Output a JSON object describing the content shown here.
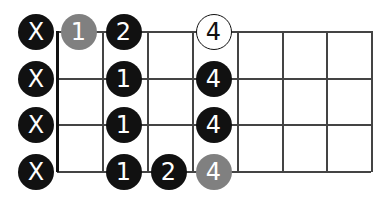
{
  "diagram": {
    "type": "fretboard",
    "strings": 4,
    "frets_shown": 7,
    "colors": {
      "line": "#444444",
      "black": "#111111",
      "gray": "#808080",
      "open": "#ffffff"
    },
    "grid": {
      "x": [
        57,
        102,
        147,
        192,
        237,
        282,
        326,
        371
      ],
      "y": [
        31,
        78,
        124,
        171
      ]
    },
    "muted": [
      {
        "string": 0,
        "label": "X"
      },
      {
        "string": 1,
        "label": "X"
      },
      {
        "string": 2,
        "label": "X"
      },
      {
        "string": 3,
        "label": "X"
      }
    ],
    "notes": [
      {
        "string": 0,
        "fret": 1,
        "label": "1",
        "style": "gray"
      },
      {
        "string": 0,
        "fret": 2,
        "label": "2",
        "style": "black"
      },
      {
        "string": 0,
        "fret": 4,
        "label": "4",
        "style": "open"
      },
      {
        "string": 1,
        "fret": 2,
        "label": "1",
        "style": "black"
      },
      {
        "string": 1,
        "fret": 4,
        "label": "4",
        "style": "black"
      },
      {
        "string": 2,
        "fret": 2,
        "label": "1",
        "style": "black"
      },
      {
        "string": 2,
        "fret": 4,
        "label": "4",
        "style": "black"
      },
      {
        "string": 3,
        "fret": 2,
        "label": "1",
        "style": "black"
      },
      {
        "string": 3,
        "fret": 3,
        "label": "2",
        "style": "black"
      },
      {
        "string": 3,
        "fret": 4,
        "label": "4",
        "style": "gray"
      }
    ]
  }
}
